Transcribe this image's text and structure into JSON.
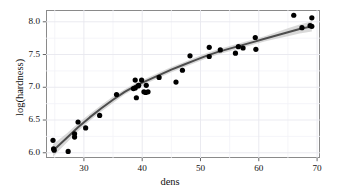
{
  "chart_data": {
    "type": "scatter",
    "title": "",
    "xlabel": "dens",
    "ylabel": "log(hardness)",
    "xlim": [
      23.5,
      70.5
    ],
    "ylim": [
      5.92,
      8.18
    ],
    "xticks": [
      30,
      40,
      50,
      60,
      70
    ],
    "yticks": [
      "6.0",
      "6.5",
      "7.0",
      "7.5",
      "8.0"
    ],
    "ytick_values": [
      6.0,
      6.5,
      7.0,
      7.5,
      8.0
    ],
    "grid": true,
    "grid_minor": true,
    "legend": "none",
    "point_color": "#000000",
    "point_size": 2.6,
    "smooth": {
      "method": "loess",
      "line_color": "#4d4d4d",
      "band_color": "#cccccc",
      "line_width": 2.0,
      "x": [
        24.7,
        27,
        29,
        31,
        33,
        35,
        37,
        39,
        41,
        43,
        45,
        47,
        49,
        51,
        53,
        55,
        57,
        59,
        61,
        63,
        65,
        67,
        69.1
      ],
      "y": [
        6.03,
        6.22,
        6.39,
        6.54,
        6.68,
        6.81,
        6.93,
        7.03,
        7.11,
        7.19,
        7.27,
        7.34,
        7.41,
        7.48,
        7.54,
        7.59,
        7.64,
        7.69,
        7.74,
        7.79,
        7.84,
        7.89,
        7.93
      ],
      "ymin": [
        5.94,
        6.15,
        6.33,
        6.49,
        6.63,
        6.76,
        6.89,
        6.99,
        7.07,
        7.15,
        7.23,
        7.3,
        7.37,
        7.44,
        7.5,
        7.55,
        7.6,
        7.65,
        7.7,
        7.74,
        7.78,
        7.82,
        7.85
      ],
      "ymax": [
        6.13,
        6.29,
        6.45,
        6.59,
        6.73,
        6.86,
        6.97,
        7.07,
        7.15,
        7.23,
        7.31,
        7.38,
        7.45,
        7.52,
        7.58,
        7.63,
        7.68,
        7.73,
        7.78,
        7.84,
        7.9,
        7.96,
        8.01
      ]
    },
    "points": [
      {
        "x": 24.7,
        "y": 6.19
      },
      {
        "x": 24.8,
        "y": 6.06
      },
      {
        "x": 24.9,
        "y": 6.04
      },
      {
        "x": 27.3,
        "y": 6.02
      },
      {
        "x": 28.4,
        "y": 6.29
      },
      {
        "x": 28.4,
        "y": 6.24
      },
      {
        "x": 29.0,
        "y": 6.47
      },
      {
        "x": 30.3,
        "y": 6.38
      },
      {
        "x": 32.7,
        "y": 6.57
      },
      {
        "x": 35.6,
        "y": 6.89
      },
      {
        "x": 38.5,
        "y": 6.98
      },
      {
        "x": 38.8,
        "y": 7.11
      },
      {
        "x": 38.8,
        "y": 6.99
      },
      {
        "x": 39.0,
        "y": 6.84
      },
      {
        "x": 39.3,
        "y": 7.02
      },
      {
        "x": 39.4,
        "y": 7.03
      },
      {
        "x": 39.9,
        "y": 7.11
      },
      {
        "x": 40.3,
        "y": 6.93
      },
      {
        "x": 40.6,
        "y": 6.92
      },
      {
        "x": 40.7,
        "y": 7.03
      },
      {
        "x": 41.0,
        "y": 6.93
      },
      {
        "x": 42.9,
        "y": 7.15
      },
      {
        "x": 45.8,
        "y": 7.08
      },
      {
        "x": 46.9,
        "y": 7.26
      },
      {
        "x": 48.2,
        "y": 7.48
      },
      {
        "x": 51.5,
        "y": 7.61
      },
      {
        "x": 51.5,
        "y": 7.47
      },
      {
        "x": 53.4,
        "y": 7.57
      },
      {
        "x": 56.0,
        "y": 7.52
      },
      {
        "x": 56.5,
        "y": 7.62
      },
      {
        "x": 57.3,
        "y": 7.6
      },
      {
        "x": 59.4,
        "y": 7.76
      },
      {
        "x": 59.5,
        "y": 7.58
      },
      {
        "x": 66.0,
        "y": 8.1
      },
      {
        "x": 67.4,
        "y": 7.91
      },
      {
        "x": 68.8,
        "y": 7.94
      },
      {
        "x": 69.1,
        "y": 8.06
      },
      {
        "x": 69.1,
        "y": 7.93
      }
    ]
  },
  "axis": {
    "x_title": "dens",
    "y_title": "log(hardness)",
    "x_tick_labels": [
      "30",
      "40",
      "50",
      "60",
      "70"
    ],
    "y_tick_labels": [
      "8.0",
      "7.5",
      "7.0",
      "6.5",
      "6.0"
    ]
  },
  "style": {
    "panel_border": "#8a8a8a",
    "grid_major": "#e8e8ee",
    "grid_minor": "#f3f3f7",
    "background": "#ffffff",
    "text_color": "#111111"
  }
}
